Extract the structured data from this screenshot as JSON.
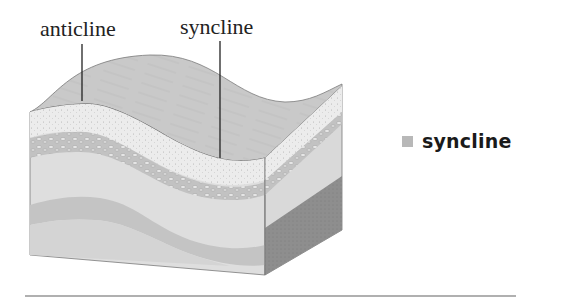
{
  "diagram": {
    "labels": [
      {
        "id": "anticline",
        "text": "anticline"
      },
      {
        "id": "syncline",
        "text": "syncline"
      }
    ],
    "colors": {
      "top_surface": "#c9c9c9",
      "sand_layer": "#ececec",
      "pebble_layer": "#bdbdbd",
      "light_stratum": "#dedede",
      "mid_stratum": "#c4c4c4",
      "deep_stratum": "#d2d2d2",
      "right_face_light": "#d9d9d9",
      "right_face_dark": "#8e8e8e",
      "outline": "#7a7a7a",
      "leader_line": "#222222"
    }
  },
  "legend": {
    "swatch_color": "#b8b8b8",
    "label": "syncline"
  }
}
